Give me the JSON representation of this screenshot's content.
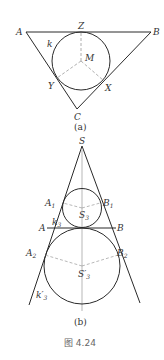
{
  "figure_a": {
    "labels": {
      "A": "A",
      "B": "B",
      "C": "C",
      "Z": "Z",
      "M": "M",
      "k": "k",
      "X": "X",
      "Y": "Y"
    },
    "caption": "(a)"
  },
  "figure_b": {
    "labels": {
      "S": "S",
      "A1": "A",
      "A1_sub": "1",
      "B1": "B",
      "B1_sub": "1",
      "S3": "S",
      "S3_sub": "3",
      "k3": "k",
      "k3_sub": "3",
      "A": "A",
      "B": "B",
      "A2": "A",
      "A2_sub": "2",
      "B2": "B",
      "B2_sub": "2",
      "S3p": "S′",
      "S3p_sub": "3",
      "k3p": "k′",
      "k3p_sub": "3"
    },
    "caption": "(b)"
  },
  "figure_title": "图 4.24",
  "colors": {
    "line": "#2a2a2a",
    "dashed": "#9a9a9a",
    "text": "#333333"
  }
}
